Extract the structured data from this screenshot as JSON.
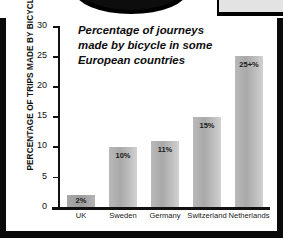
{
  "figure": {
    "frame_color": "#0a0a0a",
    "background": "#ffffff"
  },
  "decor": {
    "oval_label": "oval-arc",
    "corner_box_label": "corner-box"
  },
  "chart_data": {
    "type": "bar",
    "title": "Percentage of journeys made by bicycle in some European countries",
    "title_lines": [
      "Percentage of journeys",
      "made by bicycle in some",
      "European countries"
    ],
    "categories": [
      "UK",
      "Sweden",
      "Germany",
      "Switzerland",
      "Netherlands"
    ],
    "values": [
      2,
      10,
      11,
      15,
      25
    ],
    "data_labels": [
      "2%",
      "10%",
      "11%",
      "15%",
      "25+%"
    ],
    "xlabel": "",
    "ylabel": "PERCENTAGE OF TRIPS MADE BY BICYCLE",
    "ylim": [
      0,
      30
    ],
    "yticks": [
      0,
      5,
      10,
      15,
      20,
      25,
      30
    ],
    "ytick_labels": [
      "0",
      "5",
      "10",
      "15",
      "20",
      "25",
      "30"
    ],
    "grid": false,
    "legend": null,
    "bar_color": "#b5b5b5",
    "bar_color_highlight": "#a3a3a3",
    "axis_color": "#111111"
  }
}
